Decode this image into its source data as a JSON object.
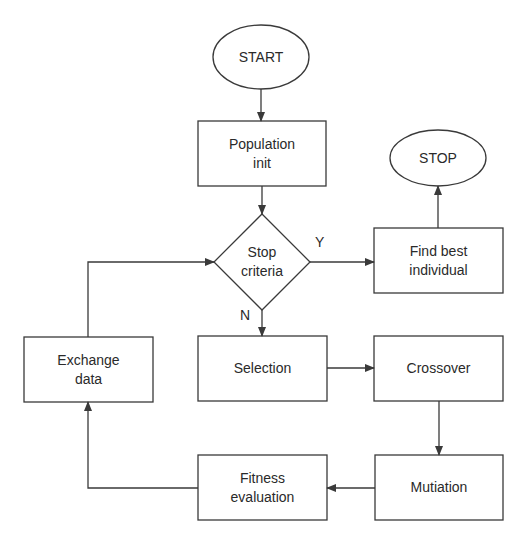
{
  "diagram": {
    "nodes": [
      {
        "id": "start",
        "label": "START",
        "shape": "ellipse"
      },
      {
        "id": "pop",
        "label": "Population\ninit",
        "shape": "rect"
      },
      {
        "id": "stop_crit",
        "label": "Stop\ncriteria",
        "shape": "diamond"
      },
      {
        "id": "find_best",
        "label": "Find best\nindividual",
        "shape": "rect"
      },
      {
        "id": "stop",
        "label": "STOP",
        "shape": "ellipse"
      },
      {
        "id": "selection",
        "label": "Selection",
        "shape": "rect"
      },
      {
        "id": "crossover",
        "label": "Crossover",
        "shape": "rect"
      },
      {
        "id": "mutation",
        "label": "Mutiation",
        "shape": "rect"
      },
      {
        "id": "fitness",
        "label": "Fitness\nevaluation",
        "shape": "rect"
      },
      {
        "id": "exchange",
        "label": "Exchange\ndata",
        "shape": "rect"
      }
    ],
    "edge_labels": {
      "yes": "Y",
      "no": "N"
    },
    "edges": [
      {
        "from": "start",
        "to": "pop"
      },
      {
        "from": "pop",
        "to": "stop_crit"
      },
      {
        "from": "stop_crit",
        "to": "find_best",
        "label": "Y"
      },
      {
        "from": "find_best",
        "to": "stop"
      },
      {
        "from": "stop_crit",
        "to": "selection",
        "label": "N"
      },
      {
        "from": "selection",
        "to": "crossover"
      },
      {
        "from": "crossover",
        "to": "mutation"
      },
      {
        "from": "mutation",
        "to": "fitness"
      },
      {
        "from": "fitness",
        "to": "exchange"
      },
      {
        "from": "exchange",
        "to": "stop_crit"
      }
    ],
    "line_color": "#3a3a3a"
  }
}
